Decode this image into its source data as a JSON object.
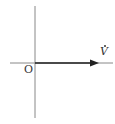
{
  "diagram": {
    "type": "phasor-diagram",
    "origin_label": "O",
    "phasor": {
      "label": "V",
      "dot": true,
      "angle_deg": 0
    },
    "colors": {
      "axis": "#888888",
      "phasor": "#222222",
      "text": "#333333"
    }
  }
}
